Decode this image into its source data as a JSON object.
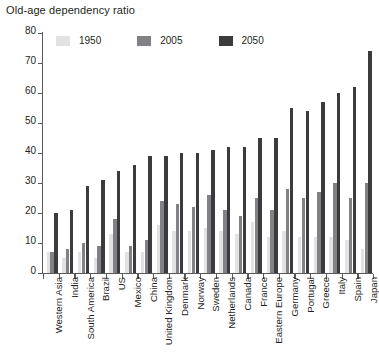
{
  "chart_data": {
    "type": "bar",
    "title": "Old-age dependency ratio",
    "xlabel": "",
    "ylabel": "",
    "ylim": [
      0,
      80
    ],
    "yticks": [
      0,
      10,
      20,
      30,
      40,
      50,
      60,
      70,
      80
    ],
    "grid": false,
    "legend_position": "top-left-inside",
    "categories": [
      "Western Asia",
      "India",
      "South America",
      "Brazil",
      "US",
      "Mexico",
      "China",
      "United Kingdom",
      "Denmark",
      "Norway",
      "Sweden",
      "Netherlands",
      "Canada",
      "France",
      "Eastern Europe",
      "Germany",
      "Portugal",
      "Greece",
      "Italy",
      "Spain",
      "Japan"
    ],
    "series": [
      {
        "name": "1950",
        "color": "#e2e2e2",
        "values": [
          7,
          5,
          7,
          5,
          13,
          7,
          7,
          16,
          14,
          14,
          15,
          14,
          13,
          17,
          12,
          14,
          12,
          12,
          12,
          11,
          8
        ]
      },
      {
        "name": "2005",
        "color": "#818285",
        "values": [
          7,
          8,
          10,
          9,
          18,
          9,
          11,
          24,
          23,
          22,
          26,
          21,
          19,
          25,
          21,
          28,
          25,
          27,
          30,
          25,
          30
        ]
      },
      {
        "name": "2050",
        "color": "#3b3b3d",
        "values": [
          20,
          21,
          29,
          31,
          34,
          36,
          39,
          39,
          40,
          40,
          41,
          42,
          42,
          45,
          45,
          55,
          54,
          57,
          60,
          62,
          74
        ]
      }
    ]
  },
  "legend": {
    "items": [
      {
        "label": "1950"
      },
      {
        "label": "2005"
      },
      {
        "label": "2050"
      }
    ]
  }
}
